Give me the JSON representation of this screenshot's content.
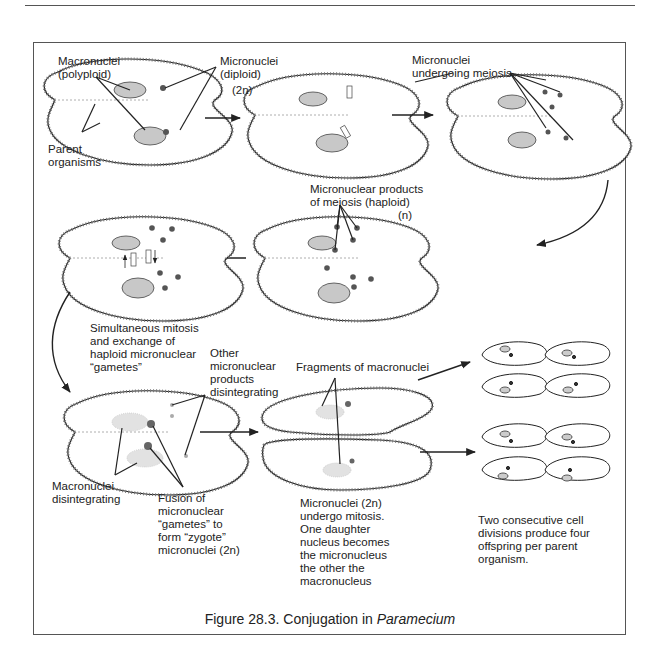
{
  "figure": {
    "caption_prefix": "Figure 28.3. Conjugation in ",
    "caption_taxon": "Paramecium",
    "colors": {
      "ink": "#222222",
      "frame": "#555555",
      "nucleus_fill": "#bdbdbd",
      "cilia": "#666666"
    }
  },
  "labels": {
    "macronuclei_polyploid": "Macronuclei\n(polyploid)",
    "micronuclei_diploid": "Micronuclei\n(diploid)",
    "ploidy_2n": "(2n)",
    "parent_organisms": "Parent\norganisms",
    "micronuclei_meiosis": "Micronuclei\nundergoing meiosis",
    "meiosis_products": "Micronuclear products\nof meiosis (haploid)",
    "ploidy_n": "(n)",
    "simultaneous_mitosis": "Simultaneous mitosis\nand exchange of\nhaploid micronuclear\n“gametes”",
    "other_products": "Other\nmicronuclear\nproducts\ndisintegrating",
    "fragments": "Fragments of macronuclei",
    "macronuclei_disintegrating": "Macronuclei\ndisintegrating",
    "fusion": "Fusion of\nmicronuclear\n“gametes” to\nform “zygote”\nmicronuclei (2n)",
    "micronuclei_mitosis": "Micronuclei (2n)\nundergo mitosis.\nOne daughter\nnucleus becomes\nthe micronucleus\nthe other the\nmacronucleus",
    "two_divisions": "Two consecutive cell\ndivisions produce four\noffspring per parent\norganism."
  },
  "stages": [
    {
      "id": 1,
      "name": "Parent organisms paired"
    },
    {
      "id": 2,
      "name": "Micronuclei undergoing meiosis (early)"
    },
    {
      "id": 3,
      "name": "Micronuclei undergoing meiosis"
    },
    {
      "id": 4,
      "name": "Haploid micronuclear products"
    },
    {
      "id": 5,
      "name": "Mitosis and exchange of gametes"
    },
    {
      "id": 6,
      "name": "Fusion into zygote micronuclei"
    },
    {
      "id": 7,
      "name": "Separated exconjugants"
    },
    {
      "id": 8,
      "name": "Eight offspring"
    }
  ]
}
